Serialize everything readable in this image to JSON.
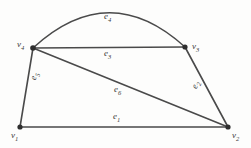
{
  "figure": {
    "background_color": "#fdfdfc",
    "stroke_color": "#4a4a4a",
    "vertex_color": "#2e2e2e"
  },
  "vertices": [
    {
      "id": "v1",
      "label": "v",
      "sub": "1",
      "x": 20,
      "y": 127,
      "label_x": 11,
      "label_y": 131
    },
    {
      "id": "v2",
      "label": "v",
      "sub": "2",
      "x": 228,
      "y": 127,
      "label_x": 232,
      "label_y": 131
    },
    {
      "id": "v3",
      "label": "v",
      "sub": "3",
      "x": 185,
      "y": 47,
      "label_x": 192,
      "label_y": 42
    },
    {
      "id": "v4",
      "label": "v",
      "sub": "4",
      "x": 33,
      "y": 48,
      "label_x": 17,
      "label_y": 40
    }
  ],
  "edges": [
    {
      "id": "e1",
      "label": "e",
      "sub": "1",
      "from": "v1",
      "to": "v2",
      "shape": "line",
      "label_x": 113,
      "label_y": 112
    },
    {
      "id": "e2",
      "label": "e",
      "sub": "2",
      "from": "v3",
      "to": "v2",
      "shape": "line",
      "label_x": 190,
      "label_y": 87
    },
    {
      "id": "e3",
      "label": "e",
      "sub": "3",
      "from": "v4",
      "to": "v3",
      "shape": "line",
      "label_x": 104,
      "label_y": 49
    },
    {
      "id": "e4",
      "label": "e",
      "sub": "4",
      "from": "v4",
      "to": "v3",
      "shape": "arc",
      "label_x": 104,
      "label_y": 12
    },
    {
      "id": "e5",
      "label": "e",
      "sub": "5",
      "from": "v1",
      "to": "v4",
      "shape": "line",
      "label_x": 29,
      "label_y": 79
    },
    {
      "id": "e6",
      "label": "e",
      "sub": "6",
      "from": "v4",
      "to": "v2",
      "shape": "line",
      "label_x": 114,
      "label_y": 85
    }
  ],
  "geometry": {
    "edge1_path": "M 20 127 L 228 127",
    "edge2_path": "M 185 47 L 228 127",
    "edge3_path": "M 33 48 L 185 47",
    "edge4_path": "M 33 48 Q 109 -22 185 47",
    "edge5_path": "M 20 127 L 33 48",
    "edge6_path": "M 33 48 L 228 127"
  }
}
